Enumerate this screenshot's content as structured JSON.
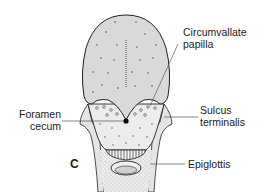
{
  "figure": {
    "panel_label": "C",
    "labels": {
      "circumvallate": {
        "line1": "Circumvallate",
        "line2": "papilla"
      },
      "foramen": {
        "line1": "Foramen",
        "line2": "cecum"
      },
      "sulcus": {
        "line1": "Sulcus",
        "line2": "terminalis"
      },
      "epiglottis": {
        "line1": "Epiglottis"
      }
    },
    "colors": {
      "outline": "#222222",
      "fill_oral": "#d9d9d9",
      "fill_pharyngeal": "#e8e8e8",
      "leader_line": "#555555"
    }
  }
}
